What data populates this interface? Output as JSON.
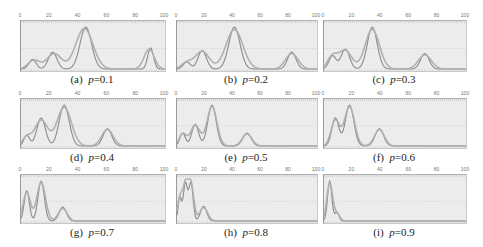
{
  "figure": {
    "x_ticks": [
      "0",
      "20",
      "40",
      "60",
      "80",
      "100"
    ],
    "colors": {
      "background": "#ececec",
      "curve_dark": "#8a8a8a",
      "curve_light": "#b0b0b0",
      "grid_dotted": "#c4c4c4"
    }
  },
  "panels": [
    {
      "id": "a",
      "label": "(a)",
      "p": "p",
      "value": "=0.1"
    },
    {
      "id": "b",
      "label": "(b)",
      "p": "p",
      "value": "=0.2"
    },
    {
      "id": "c",
      "label": "(c)",
      "p": "p",
      "value": "=0.3"
    },
    {
      "id": "d",
      "label": "(d)",
      "p": "p",
      "value": "=0.4"
    },
    {
      "id": "e",
      "label": "(e)",
      "p": "p",
      "value": "=0.5"
    },
    {
      "id": "f",
      "label": "(f)",
      "p": "p",
      "value": "=0.6"
    },
    {
      "id": "g",
      "label": "(g)",
      "p": "p",
      "value": "=0.7"
    },
    {
      "id": "h",
      "label": "(h)",
      "p": "p",
      "value": "=0.8"
    },
    {
      "id": "i",
      "label": "(i)",
      "p": "p",
      "value": "=0.9"
    }
  ],
  "chart_data": [
    {
      "type": "line",
      "title": "(a) p=0.1",
      "xlim": [
        0,
        100
      ],
      "ylim": [
        0,
        1
      ],
      "series": [
        {
          "name": "curve 1",
          "peaks": [
            {
              "x": 8,
              "h": 0.22,
              "w": 2.5
            },
            {
              "x": 22,
              "h": 0.38,
              "w": 3
            },
            {
              "x": 45,
              "h": 0.95,
              "w": 4
            },
            {
              "x": 90,
              "h": 0.48,
              "w": 2
            }
          ]
        },
        {
          "name": "curve 2",
          "peaks": [
            {
              "x": 9,
              "h": 0.2,
              "w": 4
            },
            {
              "x": 23,
              "h": 0.35,
              "w": 5
            },
            {
              "x": 44,
              "h": 0.92,
              "w": 6
            },
            {
              "x": 89,
              "h": 0.45,
              "w": 3.5
            }
          ]
        }
      ]
    },
    {
      "type": "line",
      "title": "(b) p=0.2",
      "xlim": [
        0,
        100
      ],
      "ylim": [
        0,
        1
      ],
      "series": [
        {
          "name": "curve 1",
          "peaks": [
            {
              "x": 7,
              "h": 0.16,
              "w": 2.5
            },
            {
              "x": 18,
              "h": 0.42,
              "w": 3
            },
            {
              "x": 41,
              "h": 0.95,
              "w": 4
            },
            {
              "x": 82,
              "h": 0.38,
              "w": 3
            }
          ]
        },
        {
          "name": "curve 2",
          "peaks": [
            {
              "x": 7,
              "h": 0.14,
              "w": 4
            },
            {
              "x": 18,
              "h": 0.4,
              "w": 5
            },
            {
              "x": 41,
              "h": 0.9,
              "w": 6
            },
            {
              "x": 82,
              "h": 0.35,
              "w": 4.5
            }
          ]
        }
      ]
    },
    {
      "type": "line",
      "title": "(c) p=0.3",
      "xlim": [
        0,
        100
      ],
      "ylim": [
        0,
        1
      ],
      "series": [
        {
          "name": "curve 1",
          "peaks": [
            {
              "x": 6,
              "h": 0.3,
              "w": 2.5
            },
            {
              "x": 15,
              "h": 0.45,
              "w": 3
            },
            {
              "x": 34,
              "h": 0.95,
              "w": 3.5
            },
            {
              "x": 71,
              "h": 0.35,
              "w": 3
            }
          ]
        },
        {
          "name": "curve 2",
          "peaks": [
            {
              "x": 6,
              "h": 0.28,
              "w": 3.5
            },
            {
              "x": 15,
              "h": 0.42,
              "w": 4.5
            },
            {
              "x": 34,
              "h": 0.9,
              "w": 5
            },
            {
              "x": 71,
              "h": 0.32,
              "w": 4.5
            }
          ]
        }
      ]
    },
    {
      "type": "line",
      "title": "(d) p=0.4",
      "xlim": [
        0,
        100
      ],
      "ylim": [
        0,
        1
      ],
      "series": [
        {
          "name": "curve 1",
          "peaks": [
            {
              "x": 4,
              "h": 0.25,
              "w": 2
            },
            {
              "x": 14,
              "h": 0.65,
              "w": 3
            },
            {
              "x": 30,
              "h": 0.95,
              "w": 3.5
            },
            {
              "x": 60,
              "h": 0.4,
              "w": 3
            }
          ]
        },
        {
          "name": "curve 2",
          "peaks": [
            {
              "x": 4,
              "h": 0.2,
              "w": 3
            },
            {
              "x": 14,
              "h": 0.6,
              "w": 4.5
            },
            {
              "x": 30,
              "h": 0.9,
              "w": 5
            },
            {
              "x": 60,
              "h": 0.38,
              "w": 4
            }
          ]
        }
      ]
    },
    {
      "type": "line",
      "title": "(e) p=0.5",
      "xlim": [
        0,
        100
      ],
      "ylim": [
        0,
        1
      ],
      "series": [
        {
          "name": "curve 1",
          "peaks": [
            {
              "x": 4,
              "h": 0.3,
              "w": 2
            },
            {
              "x": 13,
              "h": 0.5,
              "w": 2.5
            },
            {
              "x": 25,
              "h": 0.95,
              "w": 3
            },
            {
              "x": 50,
              "h": 0.3,
              "w": 3
            }
          ]
        },
        {
          "name": "curve 2",
          "peaks": [
            {
              "x": 4,
              "h": 0.28,
              "w": 2.5
            },
            {
              "x": 13,
              "h": 0.48,
              "w": 3.5
            },
            {
              "x": 25,
              "h": 0.92,
              "w": 3.5
            },
            {
              "x": 50,
              "h": 0.28,
              "w": 3.5
            }
          ]
        }
      ]
    },
    {
      "type": "line",
      "title": "(f) p=0.6",
      "xlim": [
        0,
        100
      ],
      "ylim": [
        0,
        1
      ],
      "series": [
        {
          "name": "curve 1",
          "peaks": [
            {
              "x": 8,
              "h": 0.65,
              "w": 2.5
            },
            {
              "x": 18,
              "h": 0.95,
              "w": 3
            },
            {
              "x": 39,
              "h": 0.4,
              "w": 3
            }
          ]
        },
        {
          "name": "curve 2",
          "peaks": [
            {
              "x": 8,
              "h": 0.6,
              "w": 3
            },
            {
              "x": 18,
              "h": 0.92,
              "w": 3.5
            },
            {
              "x": 39,
              "h": 0.38,
              "w": 3.5
            }
          ]
        }
      ]
    },
    {
      "type": "line",
      "title": "(g) p=0.7",
      "xlim": [
        0,
        100
      ],
      "ylim": [
        0,
        1
      ],
      "series": [
        {
          "name": "curve 1",
          "peaks": [
            {
              "x": 4,
              "h": 0.72,
              "w": 1.8
            },
            {
              "x": 14,
              "h": 0.95,
              "w": 2.2
            },
            {
              "x": 29,
              "h": 0.33,
              "w": 2.5
            }
          ]
        },
        {
          "name": "curve 2",
          "peaks": [
            {
              "x": 4,
              "h": 0.68,
              "w": 2.5
            },
            {
              "x": 14,
              "h": 0.92,
              "w": 3
            },
            {
              "x": 29,
              "h": 0.3,
              "w": 3
            }
          ]
        }
      ]
    },
    {
      "type": "line",
      "title": "(h) p=0.8",
      "xlim": [
        0,
        100
      ],
      "ylim": [
        0,
        1
      ],
      "series": [
        {
          "name": "curve 1",
          "peaks": [
            {
              "x": 2,
              "h": 0.55,
              "w": 1.2
            },
            {
              "x": 6,
              "h": 0.9,
              "w": 1.5
            },
            {
              "x": 10,
              "h": 0.9,
              "w": 1.5
            },
            {
              "x": 19,
              "h": 0.35,
              "w": 2.2
            }
          ]
        },
        {
          "name": "curve 2",
          "peaks": [
            {
              "x": 2,
              "h": 0.5,
              "w": 1.6
            },
            {
              "x": 6,
              "h": 0.85,
              "w": 2
            },
            {
              "x": 10,
              "h": 0.85,
              "w": 2
            },
            {
              "x": 19,
              "h": 0.32,
              "w": 2.8
            }
          ]
        }
      ]
    },
    {
      "type": "line",
      "title": "(i) p=0.9",
      "xlim": [
        0,
        100
      ],
      "ylim": [
        0,
        1
      ],
      "series": [
        {
          "name": "curve 1",
          "peaks": [
            {
              "x": 4,
              "h": 0.95,
              "w": 1.5
            },
            {
              "x": 9,
              "h": 0.2,
              "w": 1.5
            }
          ]
        },
        {
          "name": "curve 2",
          "peaks": [
            {
              "x": 4,
              "h": 0.9,
              "w": 2
            },
            {
              "x": 9,
              "h": 0.18,
              "w": 2
            }
          ]
        }
      ]
    }
  ]
}
